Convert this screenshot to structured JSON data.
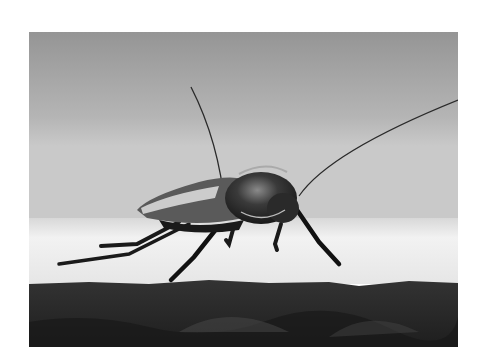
{
  "image": {
    "subject": "cockroach on ledge",
    "style": "black-and-white photograph",
    "alt": "Black and white close-up photograph of a cockroach standing on a concrete ledge with long antennae",
    "colors": {
      "background_top": "#9a9a9a",
      "background_mid": "#c4c4c4",
      "ledge_surface": "#eeeeee",
      "ledge_face": "#2a2a2a",
      "insect_body": "#1c1c1c",
      "margin": "#ffffff"
    }
  }
}
